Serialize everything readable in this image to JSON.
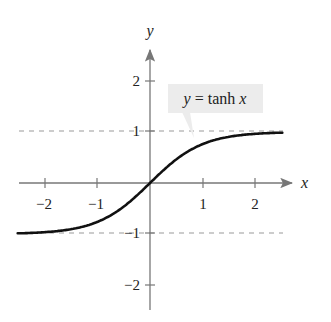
{
  "chart_data": {
    "type": "line",
    "title": "",
    "xlabel": "x",
    "ylabel": "y",
    "xlim": [
      -2.6,
      2.6
    ],
    "ylim": [
      -2.5,
      2.6
    ],
    "grid": false,
    "x_ticks": [
      -2,
      -1,
      1,
      2
    ],
    "y_ticks": [
      2,
      1,
      -1,
      -2
    ],
    "x_tick_labels": [
      "−2",
      "−1",
      "1",
      "2"
    ],
    "y_tick_labels": [
      "2",
      "1",
      "−1",
      "−2"
    ],
    "series": [
      {
        "name": "y = tanh x",
        "function": "tanh(x)",
        "x": [
          -2.5,
          -2,
          -1.5,
          -1,
          -0.5,
          0,
          0.5,
          1,
          1.5,
          2,
          2.5
        ],
        "y": [
          -0.987,
          -0.964,
          -0.905,
          -0.762,
          -0.462,
          0,
          0.462,
          0.762,
          0.905,
          0.964,
          0.987
        ]
      }
    ],
    "asymptotes": [
      {
        "type": "horizontal",
        "y": 1,
        "style": "dashed"
      },
      {
        "type": "horizontal",
        "y": -1,
        "style": "dashed"
      }
    ],
    "annotations": [
      {
        "text_parts": [
          "y",
          " = tanh ",
          "x"
        ],
        "italic": [
          true,
          false,
          true
        ],
        "points_to": [
          0.5,
          0.46
        ]
      }
    ],
    "colors": {
      "curve": "#111111",
      "axis": "#777777",
      "asymptote": "#999999",
      "callout_bg": "#ececec"
    }
  }
}
